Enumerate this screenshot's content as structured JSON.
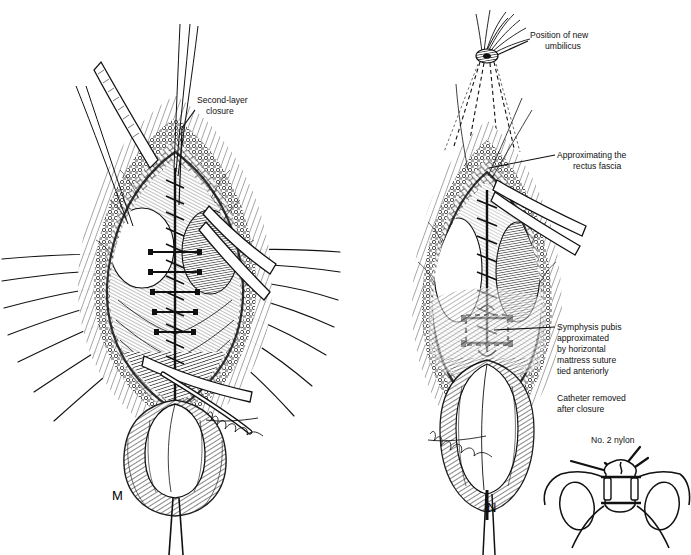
{
  "figure": {
    "background": "#ffffff",
    "ink": "#111111",
    "type": "pen-and-ink surgical illustration",
    "panels": [
      {
        "id": "panel-m",
        "letter": "M",
        "letter_pos": {
          "x": 112,
          "y": 500
        },
        "labels": [
          {
            "name": "second-layer-closure",
            "lines": [
              "Second-layer",
              "closure"
            ],
            "text_x": 197,
            "text_y": 103,
            "align": "start",
            "leader": "M195,110 L182,128 L179,205"
          }
        ],
        "signature": {
          "x": 208,
          "y": 412,
          "text": "artist-signature"
        }
      },
      {
        "id": "panel-n",
        "letter": "N",
        "letter_pos": {
          "x": 487,
          "y": 512
        },
        "labels": [
          {
            "name": "position-of-new-umbilicus",
            "lines": [
              "Position of new",
              "umbilicus"
            ],
            "text_x": 530,
            "text_y": 38,
            "align": "start",
            "leader": "M528,41 L497,55"
          },
          {
            "name": "approximating-the-rectus-fascia",
            "lines": [
              "Approximating the",
              "rectus fascia"
            ],
            "text_x": 557,
            "text_y": 158,
            "align": "start",
            "leader": "M555,155 L489,168"
          },
          {
            "name": "symphysis-pubis-approximated",
            "lines": [
              "Symphysis pubis",
              "approximated",
              "by horizontal",
              "mattress suture",
              "tied anteriorly"
            ],
            "text_x": 557,
            "text_y": 329,
            "align": "start",
            "leader": "M555,327 L494,330"
          },
          {
            "name": "catheter-removed-after-closure",
            "lines": [
              "Catheter removed",
              "after closure"
            ],
            "text_x": 557,
            "text_y": 397,
            "align": "start",
            "leader": ""
          }
        ],
        "signature": {
          "x": 472,
          "y": 430,
          "text": "artist-signature"
        }
      },
      {
        "id": "panel-inset",
        "letter": "",
        "labels": [
          {
            "name": "no-2-nylon",
            "lines": [
              "No. 2 nylon"
            ],
            "text_x": 591,
            "text_y": 443,
            "align": "start",
            "leader": "M640,447 L623,468"
          }
        ]
      }
    ]
  }
}
